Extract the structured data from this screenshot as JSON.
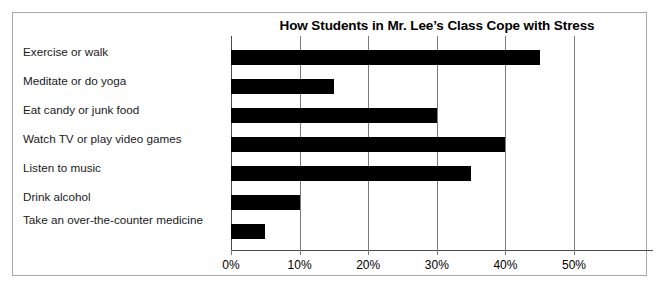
{
  "chart_data": {
    "type": "bar",
    "orientation": "horizontal",
    "title": "How Students in Mr. Lee’s Class Cope with Stress",
    "xlabel": "",
    "ylabel": "",
    "categories": [
      "Exercise or walk",
      "Meditate or do yoga",
      "Eat candy or junk food",
      "Watch TV or play video games",
      "Listen to music",
      "Drink alcohol",
      "Take an over-the-counter medicine"
    ],
    "values": [
      45,
      15,
      30,
      40,
      35,
      10,
      5
    ],
    "xlim": [
      0,
      50
    ],
    "xticks": [
      0,
      10,
      20,
      30,
      40,
      50
    ],
    "xtick_labels": [
      "0%",
      "10%",
      "20%",
      "30%",
      "40%",
      "50%"
    ],
    "grid": true,
    "legend": false,
    "bar_color": "#000000",
    "grid_color": "#7a7a7a",
    "axis_color": "#4a4a4a",
    "frame_color": "#a8a8a8"
  }
}
